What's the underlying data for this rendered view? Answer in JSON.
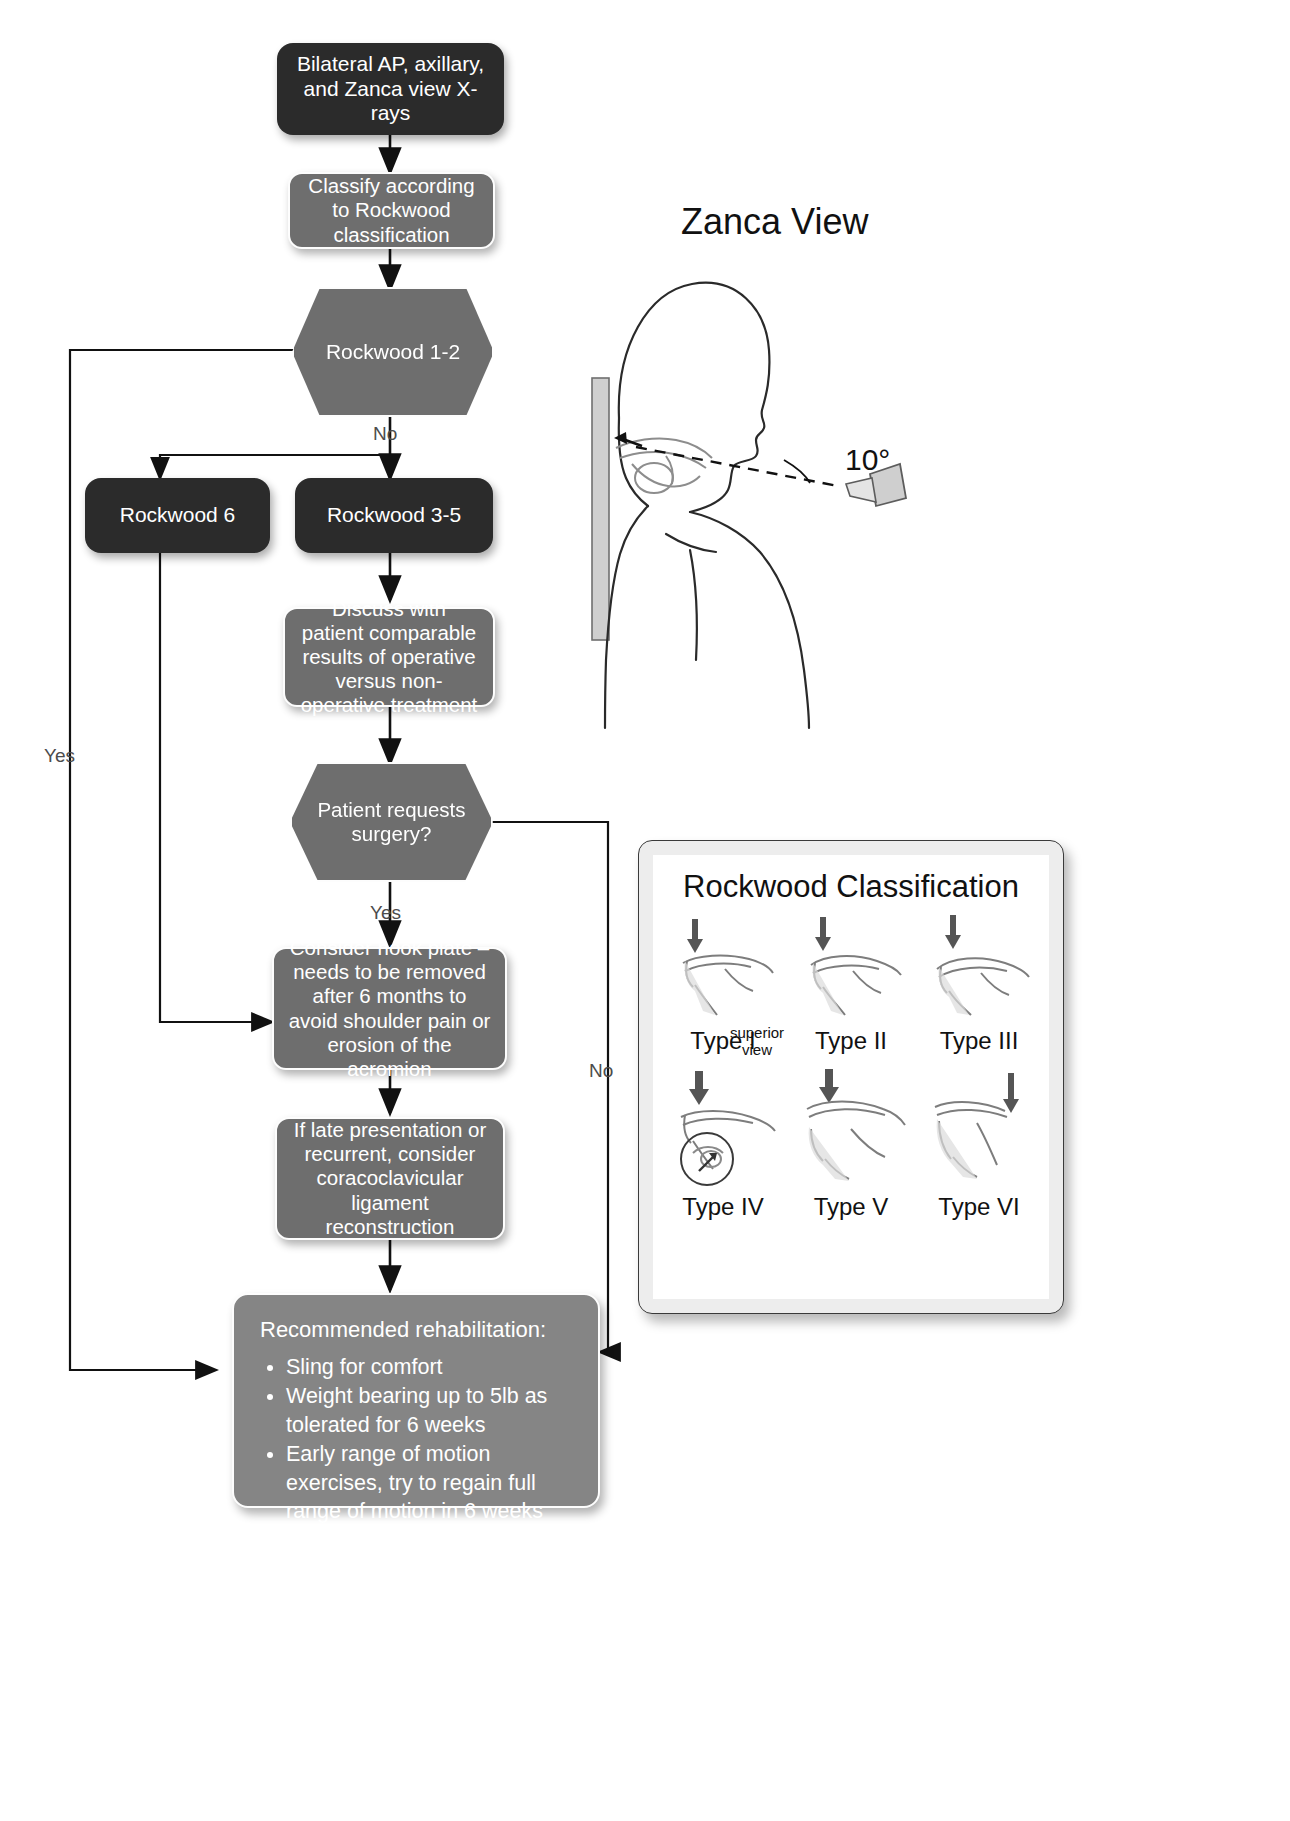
{
  "flow": {
    "nodes": [
      {
        "id": "xrays",
        "label": "Bilateral AP, axillary, and Zanca view X-rays",
        "style": "dark"
      },
      {
        "id": "classify",
        "label": "Classify according to Rockwood classification",
        "style": "grey"
      },
      {
        "id": "rockwood12",
        "label": "Rockwood 1-2",
        "style": "hex"
      },
      {
        "id": "rockwood6",
        "label": "Rockwood 6",
        "style": "dark"
      },
      {
        "id": "rockwood35",
        "label": "Rockwood 3-5",
        "style": "dark"
      },
      {
        "id": "discuss",
        "label": "Discuss with patient comparable results of operative versus non-operative treatment",
        "style": "grey"
      },
      {
        "id": "requests",
        "label": "Patient requests surgery?",
        "style": "hex"
      },
      {
        "id": "hookplate",
        "label": "Consider hook plate – needs to be removed after 6 months to avoid shoulder pain or erosion of the acromion",
        "style": "grey"
      },
      {
        "id": "reconstruction",
        "label": "If late presentation or recurrent, consider coracoclavicular ligament reconstruction",
        "style": "grey"
      }
    ],
    "edge_labels": {
      "rockwood12_yes": "Yes",
      "rockwood12_no": "No",
      "requests_yes": "Yes",
      "requests_no": "No"
    }
  },
  "rehab": {
    "heading": "Recommended rehabilitation:",
    "items": [
      "Sling for comfort",
      "Weight bearing up to 5lb as tolerated for 6 weeks",
      "Early range of motion exercises, try to regain full range of motion in 6 weeks",
      "Return to normal activity in 12 weeks"
    ]
  },
  "zanca": {
    "title": "Zanca View",
    "angle": "10°"
  },
  "rockwood_panel": {
    "title": "Rockwood Classification",
    "types": [
      {
        "label": "Type I"
      },
      {
        "label": "Type II"
      },
      {
        "label": "Type III"
      },
      {
        "label": "Type IV",
        "annotation": "superior\nview"
      },
      {
        "label": "Type V"
      },
      {
        "label": "Type VI"
      }
    ],
    "superior_view_label": "superior view"
  }
}
